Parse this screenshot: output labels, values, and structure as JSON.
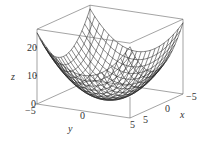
{
  "chart_data": {
    "type": "surface3d",
    "title": "",
    "function_shape": "paraboloid z = x^2 + y^2 (approx, min 0 at origin, ~25 at corners)",
    "xlabel": "x",
    "ylabel": "y",
    "zlabel": "z",
    "x_range": [
      -5,
      5
    ],
    "y_range": [
      -5,
      5
    ],
    "z_range": [
      0,
      25
    ],
    "x_ticks": [
      "-5",
      "0",
      "5"
    ],
    "y_ticks": [
      "-5",
      "0",
      "5"
    ],
    "z_ticks": [
      "0",
      "10",
      "20"
    ],
    "grid": false,
    "box": true,
    "style": "wireframe mesh, black lines on white"
  },
  "labels": {
    "z_axis": "z",
    "y_axis": "y",
    "x_axis": "x",
    "z_tick_0": "0",
    "z_tick_10": "10",
    "z_tick_20": "20",
    "y_tick_neg5": "−5",
    "y_tick_0": "0",
    "y_tick_5": "5",
    "x_tick_5": "5",
    "x_tick_0": "0",
    "x_tick_neg5": "−5"
  },
  "colors": {
    "line": "#222222",
    "box": "#555555",
    "background": "#ffffff"
  }
}
